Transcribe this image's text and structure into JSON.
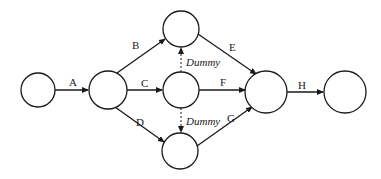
{
  "diagram": {
    "type": "activity-on-arrow network",
    "nodes": [
      {
        "id": "n1",
        "cx": 38,
        "cy": 90,
        "r": 17
      },
      {
        "id": "n2",
        "cx": 108,
        "cy": 90,
        "r": 19
      },
      {
        "id": "n3",
        "cx": 181,
        "cy": 29,
        "r": 18
      },
      {
        "id": "n4",
        "cx": 181,
        "cy": 90,
        "r": 18
      },
      {
        "id": "n5",
        "cx": 180,
        "cy": 151,
        "r": 18
      },
      {
        "id": "n6",
        "cx": 266,
        "cy": 92,
        "r": 21
      },
      {
        "id": "n7",
        "cx": 345,
        "cy": 92,
        "r": 21
      }
    ],
    "activities": [
      {
        "label": "A",
        "from": "n1",
        "to": "n2"
      },
      {
        "label": "B",
        "from": "n2",
        "to": "n3"
      },
      {
        "label": "C",
        "from": "n2",
        "to": "n4"
      },
      {
        "label": "D",
        "from": "n2",
        "to": "n5"
      },
      {
        "label": "E",
        "from": "n3",
        "to": "n6"
      },
      {
        "label": "F",
        "from": "n4",
        "to": "n6"
      },
      {
        "label": "G",
        "from": "n5",
        "to": "n6"
      },
      {
        "label": "H",
        "from": "n6",
        "to": "n7"
      },
      {
        "label": "Dummy",
        "from": "n4",
        "to": "n3",
        "dashed": true
      },
      {
        "label": "Dummy",
        "from": "n4",
        "to": "n5",
        "dashed": true
      }
    ]
  }
}
